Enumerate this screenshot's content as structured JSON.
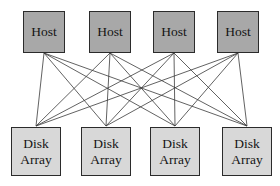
{
  "diagram": {
    "type": "bipartite-mesh-diagram",
    "background_color": "#ffffff",
    "canvas": {
      "width": 280,
      "height": 186
    },
    "style": {
      "host_fill": "#a8a8a8",
      "array_fill": "#d8d8d8",
      "border_color": "#2b2b2b",
      "link_color": "#3a3a3a",
      "link_width": 0.8
    },
    "hosts": [
      {
        "id": "host-1",
        "label": "Host",
        "x": 23,
        "y": 11,
        "width": 42,
        "height": 42,
        "port_x": 44,
        "port_y": 53
      },
      {
        "id": "host-2",
        "label": "Host",
        "x": 89,
        "y": 11,
        "width": 42,
        "height": 42,
        "port_x": 110,
        "port_y": 53
      },
      {
        "id": "host-3",
        "label": "Host",
        "x": 153,
        "y": 11,
        "width": 42,
        "height": 42,
        "port_x": 174,
        "port_y": 53
      },
      {
        "id": "host-4",
        "label": "Host",
        "x": 217,
        "y": 11,
        "width": 42,
        "height": 42,
        "port_x": 238,
        "port_y": 53
      }
    ],
    "disk_arrays": [
      {
        "id": "array-1",
        "label_line1": "Disk",
        "label_line2": "Array",
        "x": 11,
        "y": 127,
        "width": 50,
        "height": 49,
        "port_x": 36,
        "port_y": 126
      },
      {
        "id": "array-2",
        "label_line1": "Disk",
        "label_line2": "Array",
        "x": 81,
        "y": 127,
        "width": 50,
        "height": 49,
        "port_x": 106,
        "port_y": 126
      },
      {
        "id": "array-3",
        "label_line1": "Disk",
        "label_line2": "Array",
        "x": 150,
        "y": 127,
        "width": 50,
        "height": 49,
        "port_x": 175,
        "port_y": 126
      },
      {
        "id": "array-4",
        "label_line1": "Disk",
        "label_line2": "Array",
        "x": 222,
        "y": 127,
        "width": 50,
        "height": 49,
        "port_x": 247,
        "port_y": 126
      }
    ],
    "links": [
      {
        "from": "host-1",
        "to": "array-1"
      },
      {
        "from": "host-1",
        "to": "array-2"
      },
      {
        "from": "host-1",
        "to": "array-3"
      },
      {
        "from": "host-1",
        "to": "array-4"
      },
      {
        "from": "host-2",
        "to": "array-1"
      },
      {
        "from": "host-2",
        "to": "array-2"
      },
      {
        "from": "host-2",
        "to": "array-3"
      },
      {
        "from": "host-2",
        "to": "array-4"
      },
      {
        "from": "host-3",
        "to": "array-1"
      },
      {
        "from": "host-3",
        "to": "array-2"
      },
      {
        "from": "host-3",
        "to": "array-3"
      },
      {
        "from": "host-3",
        "to": "array-4"
      },
      {
        "from": "host-4",
        "to": "array-1"
      },
      {
        "from": "host-4",
        "to": "array-2"
      },
      {
        "from": "host-4",
        "to": "array-3"
      },
      {
        "from": "host-4",
        "to": "array-4"
      }
    ]
  }
}
